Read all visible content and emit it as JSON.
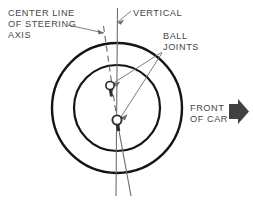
{
  "figure": {
    "background_color": "#ffffff",
    "line_color": "#1a1a1a",
    "thin_line_color": "#6b6e72",
    "text_color": "#45474a",
    "arrow_color": "#3f4145"
  },
  "labels": {
    "center_line_of_steering_axis": "CENTER LINE\nOF STEERING\nAXIS",
    "vertical": "VERTICAL",
    "ball_joints": "BALL\nJOINTS",
    "front_of_car": "FRONT\nOF CAR"
  },
  "geometry": {
    "outer_circle": {
      "cx": 117,
      "cy": 108,
      "r": 65
    },
    "inner_circle": {
      "cx": 117,
      "cy": 108,
      "r": 43
    },
    "vertical_line": {
      "x1": 117,
      "y1": 8,
      "x2": 116,
      "y2": 196
    },
    "steering_axis_line": {
      "x1": 104,
      "y1": 26,
      "x2": 131,
      "y2": 196
    },
    "ball_joint_upper": {
      "cx": 110,
      "cy": 86,
      "r": 4
    },
    "ball_joint_lower": {
      "cx": 117,
      "cy": 120,
      "r": 4.5
    }
  },
  "icons": {
    "front_arrow": "right-arrow-icon"
  }
}
